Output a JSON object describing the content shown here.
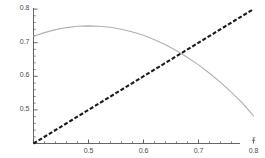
{
  "chart_data": {
    "type": "line",
    "title": "",
    "xlabel": "x",
    "ylabel": "",
    "xlim": [
      0.4,
      0.81
    ],
    "ylim": [
      0.4,
      0.815
    ],
    "grid": false,
    "legend": "none",
    "xticks": [
      0.5,
      0.6,
      0.7,
      0.8
    ],
    "xtick_labels": [
      "0.5",
      "0.6",
      "0.7",
      "0.8"
    ],
    "yticks": [
      0.5,
      0.6,
      0.7,
      0.8
    ],
    "ytick_labels": [
      "0.5",
      "0.6",
      "0.7",
      "0.8"
    ],
    "minor_ticks": true,
    "series": [
      {
        "name": "concave-curve",
        "style": "solid",
        "color": "#b0b0b0",
        "width": 1.1,
        "x": [
          0.4,
          0.42,
          0.44,
          0.46,
          0.48,
          0.5,
          0.52,
          0.54,
          0.56,
          0.58,
          0.6,
          0.62,
          0.64,
          0.66,
          0.68,
          0.7,
          0.72,
          0.74,
          0.76,
          0.78,
          0.8
        ],
        "y": [
          0.719,
          0.73,
          0.739,
          0.745,
          0.749,
          0.75,
          0.749,
          0.746,
          0.74,
          0.732,
          0.722,
          0.709,
          0.694,
          0.676,
          0.656,
          0.634,
          0.609,
          0.582,
          0.552,
          0.52,
          0.482
        ]
      },
      {
        "name": "identity-line",
        "style": "dashed",
        "color": "#1a1a1a",
        "width": 2.1,
        "dash": "4 2",
        "x": [
          0.4,
          0.8
        ],
        "y": [
          0.4,
          0.8
        ]
      }
    ],
    "annotations": {
      "intersection": {
        "x": 0.665,
        "y": 0.665
      }
    }
  },
  "axis": {
    "x_axis_label": "x",
    "y_axis_label": ""
  }
}
